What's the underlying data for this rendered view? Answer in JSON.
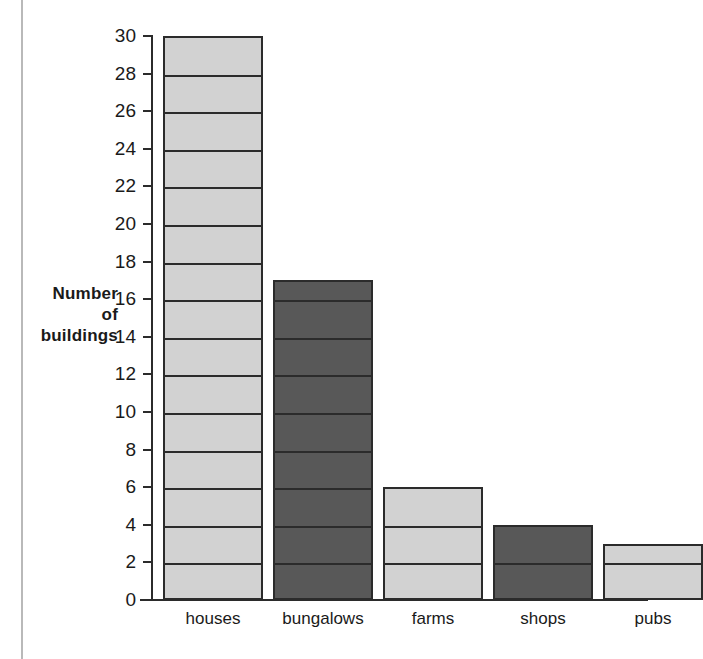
{
  "chart_data": {
    "type": "bar",
    "title": "",
    "xlabel": "",
    "ylabel": "Number of buildings",
    "ylabel_lines": [
      "Number",
      "of",
      "buildings"
    ],
    "categories": [
      "houses",
      "bungalows",
      "farms",
      "shops",
      "pubs"
    ],
    "values": [
      30,
      17,
      6,
      4,
      3
    ],
    "bar_styles": [
      "light",
      "dark",
      "light",
      "dark",
      "light"
    ],
    "ylim": [
      0,
      30
    ],
    "ytick_step": 2,
    "yticks": [
      0,
      2,
      4,
      6,
      8,
      10,
      12,
      14,
      16,
      18,
      20,
      22,
      24,
      26,
      28,
      30
    ],
    "ytick_labels": [
      "0",
      "2",
      "4",
      "6",
      "8",
      "10",
      "12",
      "14",
      "16",
      "18",
      "20",
      "22",
      "24",
      "26",
      "28",
      "30"
    ],
    "grid": false,
    "bar_internal_rule_step": 2,
    "legend": null,
    "legend_position": "none",
    "annotations": []
  },
  "colors": {
    "bar_light": "#d2d2d2",
    "bar_dark": "#585858",
    "outline": "#2b2b2b",
    "text": "#1a1a1a",
    "page_edge": "#b9b9b9",
    "background": "#ffffff"
  }
}
